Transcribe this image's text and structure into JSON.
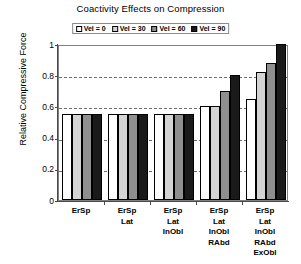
{
  "chart_data": {
    "type": "bar",
    "title": "Coactivity Effects on Compression",
    "xlabel": "",
    "ylabel": "Relative Compressive Force",
    "ylim": [
      0,
      1
    ],
    "yticks": [
      "0",
      "0.2",
      "0.4",
      "0.6",
      "0.8",
      "1"
    ],
    "ytick_values": [
      0,
      0.2,
      0.4,
      0.6,
      0.8,
      1
    ],
    "grid": "horizontal-dashed",
    "legend_position": "top-center",
    "categories": [
      "ErSp",
      "ErSp Lat",
      "ErSp Lat InObl",
      "ErSp Lat InObl RAbd",
      "ErSp Lat InObl RAbd ExObl"
    ],
    "category_lines": [
      [
        "ErSp"
      ],
      [
        "ErSp",
        "Lat"
      ],
      [
        "ErSp",
        "Lat",
        "InObl"
      ],
      [
        "ErSp",
        "Lat",
        "InObl",
        "RAbd"
      ],
      [
        "ErSp",
        "Lat",
        "InObl",
        "RAbd",
        "ExObl"
      ]
    ],
    "series": [
      {
        "name": "Vel = 0",
        "color": "#ffffff",
        "values": [
          0.55,
          0.55,
          0.55,
          0.6,
          0.65
        ]
      },
      {
        "name": "Vel = 30",
        "color": "#d4d4d4",
        "values": [
          0.55,
          0.55,
          0.55,
          0.6,
          0.82
        ]
      },
      {
        "name": "Vel = 60",
        "color": "#8f8f8f",
        "values": [
          0.55,
          0.55,
          0.55,
          0.7,
          0.88
        ]
      },
      {
        "name": "Vel = 90",
        "color": "#1a1a1a",
        "values": [
          0.55,
          0.55,
          0.55,
          0.8,
          1.0
        ]
      }
    ]
  },
  "legend": {
    "items": [
      {
        "label": "Vel = 0",
        "color": "#ffffff"
      },
      {
        "label": "Vel = 30",
        "color": "#d4d4d4"
      },
      {
        "label": "Vel = 60",
        "color": "#8f8f8f"
      },
      {
        "label": "Vel = 90",
        "color": "#1a1a1a"
      }
    ]
  }
}
